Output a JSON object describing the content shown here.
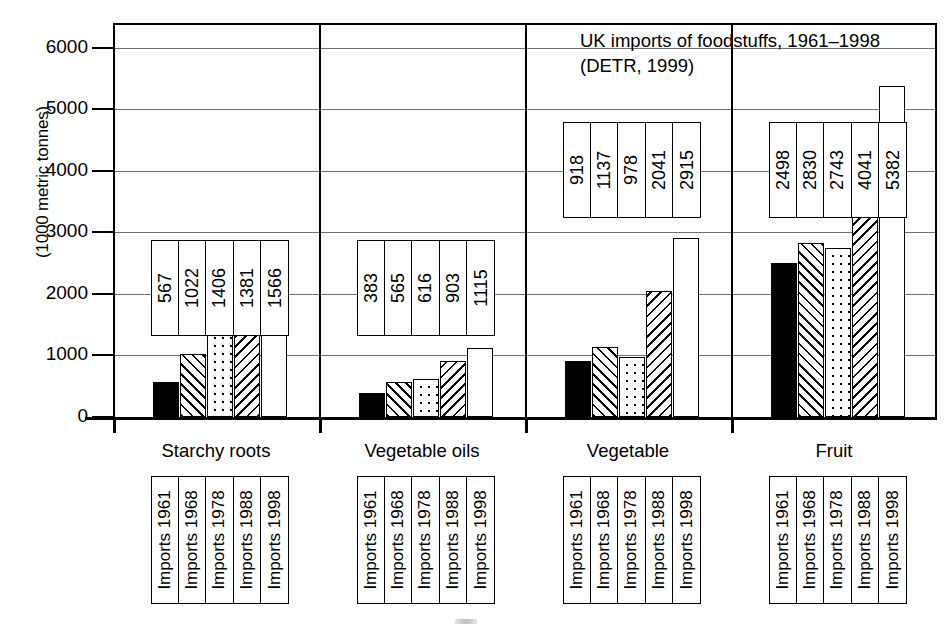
{
  "chart_data": {
    "type": "bar",
    "title": "UK imports of foodstuffs, 1961–1998 (DETR, 1999)",
    "title_lines": [
      "UK imports of foodstuffs, 1961–1998",
      "(DETR, 1999)"
    ],
    "xlabel": "",
    "ylabel": "(1000 metric tonnes)",
    "ylim": [
      0,
      6400
    ],
    "yticks": [
      0,
      1000,
      2000,
      3000,
      4000,
      5000,
      6000
    ],
    "ytick_labels": [
      "0",
      "1000",
      "2000",
      "3000",
      "4000",
      "5000",
      "6000"
    ],
    "grid": true,
    "legend_position": "below-axis-rotated",
    "categories": [
      "Starchy roots",
      "Vegetable oils",
      "Vegetable",
      "Fruit"
    ],
    "series": [
      {
        "name": "Imports 1961",
        "pattern": "solid-black",
        "values": [
          567,
          383,
          918,
          2498
        ]
      },
      {
        "name": "Imports 1968",
        "pattern": "hatch-diagonal-up",
        "values": [
          1022,
          565,
          1137,
          2830
        ]
      },
      {
        "name": "Imports 1978",
        "pattern": "dots",
        "values": [
          1406,
          616,
          978,
          2743
        ]
      },
      {
        "name": "Imports 1988",
        "pattern": "hatch-diagonal-down",
        "values": [
          1381,
          903,
          2041,
          4041
        ]
      },
      {
        "name": "Imports 1998",
        "pattern": "white",
        "values": [
          1566,
          1115,
          2915,
          5382
        ]
      }
    ],
    "data_labels": {
      "Starchy roots": [
        "567",
        "1022",
        "1406",
        "1381",
        "1566"
      ],
      "Vegetable oils": [
        "383",
        "565",
        "616",
        "903",
        "1115"
      ],
      "Vegetable": [
        "918",
        "1137",
        "978",
        "2041",
        "2915"
      ],
      "Fruit": [
        "2498",
        "2830",
        "2743",
        "4041",
        "5382"
      ]
    },
    "legend_labels": [
      "Imports 1961",
      "Imports 1968",
      "Imports 1978",
      "Imports 1988",
      "Imports 1998"
    ]
  },
  "colors": {
    "axis": "#000000",
    "grid": "#6e6e6e",
    "bar_outline": "#000000",
    "background": "#ffffff"
  }
}
